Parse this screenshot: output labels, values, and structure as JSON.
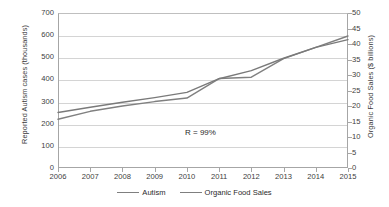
{
  "chart_data": {
    "type": "line",
    "title": "",
    "subtitle": "",
    "xlabel": "",
    "ylabel": "Reported Autism cases (thousands)",
    "y2label": "Organic Food Sales  ($ billions)",
    "x": [
      2006,
      2007,
      2008,
      2009,
      2010,
      2011,
      2012,
      2013,
      2014,
      2015
    ],
    "xtick_labels": [
      "2006",
      "2007",
      "2008",
      "2009",
      "2010",
      "2011",
      "2012",
      "2013",
      "2014",
      "2015"
    ],
    "xlim": [
      2006,
      2015
    ],
    "ylim": [
      0,
      700
    ],
    "ytick_labels": [
      "700",
      "600",
      "500",
      "400",
      "300",
      "200",
      "100",
      "0"
    ],
    "yticks": [
      700,
      600,
      500,
      400,
      300,
      200,
      100,
      0
    ],
    "y2lim": [
      0,
      50
    ],
    "y2tick_labels": [
      "50",
      "45",
      "40",
      "35",
      "30",
      "25",
      "20",
      "15",
      "10",
      "5",
      "0"
    ],
    "y2ticks": [
      50,
      45,
      40,
      35,
      30,
      25,
      20,
      15,
      10,
      5,
      0
    ],
    "grid": true,
    "grid_axis": "y",
    "legend_position": "bottom",
    "series": [
      {
        "name": "Autism",
        "axis": "left",
        "color": "#808080",
        "values": [
          220,
          256,
          280,
          300,
          316,
          404,
          410,
          494,
          545,
          596
        ]
      },
      {
        "name": "Organic Food Sales",
        "axis": "right",
        "color": "#7a7a7a",
        "values": [
          17.9,
          19.6,
          21.2,
          22.7,
          24.4,
          28.8,
          31.4,
          35.4,
          38.9,
          41.4
        ]
      }
    ],
    "annotations": [
      {
        "text": "R = 99%",
        "x": 2012,
        "y": 130
      }
    ]
  },
  "legend": {
    "items": [
      {
        "label": "Autism"
      },
      {
        "label": "Organic Food Sales"
      }
    ]
  }
}
